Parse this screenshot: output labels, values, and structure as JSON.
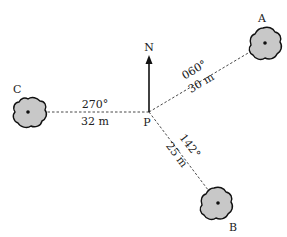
{
  "diagram": {
    "type": "bearing-diagram",
    "north_label": "N",
    "origin": {
      "label": "P",
      "x": 149,
      "y": 112
    },
    "points": [
      {
        "id": "A",
        "label": "A",
        "x": 265,
        "y": 43,
        "bearing": "060°",
        "distance": "30 m"
      },
      {
        "id": "B",
        "label": "B",
        "x": 218,
        "y": 203,
        "bearing": "142°",
        "distance": "25 m"
      },
      {
        "id": "C",
        "label": "C",
        "x": 28,
        "y": 112,
        "bearing": "270°",
        "distance": "32 m"
      }
    ],
    "colors": {
      "bush_fill": "#c8c8c8",
      "outline": "#111111",
      "line": "#333333"
    }
  }
}
